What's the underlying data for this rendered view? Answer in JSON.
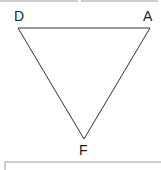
{
  "diagram": {
    "type": "triangle",
    "vertices": [
      {
        "label": "D",
        "x": 18,
        "y": 28
      },
      {
        "label": "A",
        "x": 150,
        "y": 28
      },
      {
        "label": "F",
        "x": 84,
        "y": 139
      }
    ],
    "stroke_color": "#333333"
  }
}
